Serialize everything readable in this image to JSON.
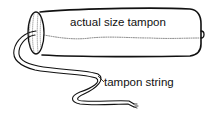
{
  "diagram": {
    "labels": {
      "body": "actual size tampon",
      "string": "tampon string"
    },
    "colors": {
      "line": "#111111",
      "background": "#ffffff"
    }
  }
}
